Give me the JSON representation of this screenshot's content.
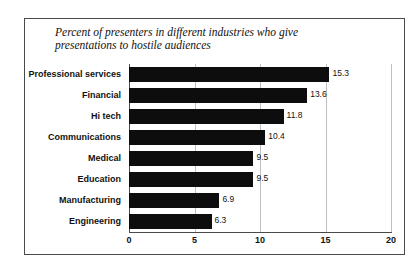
{
  "page": {
    "heading": "Chart 3-9: How Hostile Are Audiences?"
  },
  "chart_data": {
    "type": "bar",
    "orientation": "horizontal",
    "title": "Percent of presenters in different industries who give presentations to hostile audiences",
    "xlabel": "",
    "ylabel": "",
    "xlim": [
      0,
      20
    ],
    "xticks": [
      "0",
      "5",
      "10",
      "15",
      "20"
    ],
    "grid": true,
    "legend": false,
    "bar_color": "#0d0d0d",
    "categories": [
      "Professional services",
      "Financial",
      "Hi tech",
      "Communications",
      "Medical",
      "Education",
      "Manufacturing",
      "Engineering"
    ],
    "values": [
      15.3,
      13.6,
      11.8,
      10.4,
      9.5,
      9.5,
      6.9,
      6.3
    ],
    "value_labels": [
      "15.3",
      "13.6",
      "11.8",
      "10.4",
      "9.5",
      "9.5",
      "6.9",
      "6.3"
    ]
  }
}
